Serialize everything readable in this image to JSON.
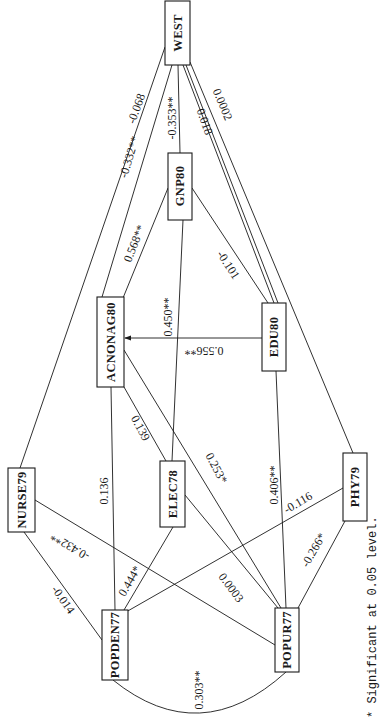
{
  "diagram": {
    "type": "path-diagram",
    "orientation": "rotated-90-clockwise",
    "nodes": [
      {
        "id": "WEST",
        "label": "WEST",
        "x": 165,
        "y": 1,
        "w": 25,
        "h": 64
      },
      {
        "id": "GNP80",
        "label": "GNP80",
        "x": 168,
        "y": 153,
        "w": 24,
        "h": 67
      },
      {
        "id": "ACNONAG80",
        "label": "ACNONAG80",
        "x": 97,
        "y": 297,
        "w": 27,
        "h": 90
      },
      {
        "id": "EDU80",
        "label": "EDU80",
        "x": 262,
        "y": 303,
        "w": 24,
        "h": 68
      },
      {
        "id": "NURSE79",
        "label": "NURSE79",
        "x": 8,
        "y": 468,
        "w": 27,
        "h": 64
      },
      {
        "id": "ELEC78",
        "label": "ELEC78",
        "x": 160,
        "y": 461,
        "w": 25,
        "h": 66
      },
      {
        "id": "PHY79",
        "label": "PHY79",
        "x": 343,
        "y": 453,
        "w": 24,
        "h": 68
      },
      {
        "id": "POPDEN77",
        "label": "POPDEN77",
        "x": 102,
        "y": 610,
        "w": 26,
        "h": 70
      },
      {
        "id": "POPUR77",
        "label": "POPUR77",
        "x": 275,
        "y": 608,
        "w": 24,
        "h": 64
      }
    ],
    "edges": [
      {
        "from": "WEST",
        "to": "NURSE79",
        "label": "-0.068",
        "significance": "none"
      },
      {
        "from": "WEST",
        "to": "ACNONAG80",
        "label": "-0.332**",
        "significance": "**"
      },
      {
        "from": "WEST",
        "to": "GNP80",
        "label": "-0.353**",
        "significance": "**"
      },
      {
        "from": "WEST",
        "to": "EDU80",
        "label": "0.018",
        "significance": "none"
      },
      {
        "from": "WEST",
        "to": "PHY79",
        "label": "0.0002",
        "significance": "none"
      },
      {
        "from": "GNP80",
        "to": "ACNONAG80",
        "label": "0.568**",
        "significance": "**"
      },
      {
        "from": "GNP80",
        "to": "EDU80",
        "label": "-0.101",
        "significance": "none"
      },
      {
        "from": "GNP80",
        "to": "ELEC78",
        "label": "0.450**",
        "significance": "**"
      },
      {
        "from": "EDU80",
        "to": "ACNONAG80",
        "label": "0.556**",
        "significance": "**",
        "arrow": true
      },
      {
        "from": "ACNONAG80",
        "to": "POPDEN77",
        "label": "0.136",
        "significance": "none"
      },
      {
        "from": "ACNONAG80",
        "to": "ELEC78",
        "label": "0.139",
        "significance": "none"
      },
      {
        "from": "ACNONAG80",
        "to": "POPUR77",
        "label": "0.253*",
        "significance": "*"
      },
      {
        "from": "EDU80",
        "to": "POPUR77",
        "label": "0.406**",
        "significance": "**"
      },
      {
        "from": "NURSE79",
        "to": "POPDEN77",
        "label": "-0.014",
        "significance": "none"
      },
      {
        "from": "NURSE79",
        "to": "POPUR77",
        "label": "-0.432**",
        "significance": "**"
      },
      {
        "from": "ELEC78",
        "to": "POPDEN77",
        "label": "0.444*",
        "significance": "*"
      },
      {
        "from": "ELEC78",
        "to": "POPUR77",
        "label": "0.0003",
        "significance": "none"
      },
      {
        "from": "PHY79",
        "to": "POPDEN77",
        "label": "-0.116",
        "significance": "none"
      },
      {
        "from": "PHY79",
        "to": "POPUR77",
        "label": "-0.266*",
        "significance": "*"
      },
      {
        "from": "POPDEN77",
        "to": "POPUR77",
        "label": "0.303**",
        "significance": "**",
        "curved": true
      }
    ]
  },
  "nodes": {
    "west": "WEST",
    "gnp80": "GNP80",
    "acnonag80": "ACNONAG80",
    "edu80": "EDU80",
    "nurse79": "NURSE79",
    "elec78": "ELEC78",
    "phy79": "PHY79",
    "popden77": "POPDEN77",
    "popur77": "POPUR77"
  },
  "edge_labels": {
    "west_nurse79": "-0.068",
    "west_acnonag80": "-0.332**",
    "west_gnp80": "-0.353**",
    "west_edu80": "0.018",
    "west_phy79": "0.0002",
    "gnp80_acnonag80": "0.568**",
    "gnp80_edu80": "-0.101",
    "gnp80_elec78": "0.450**",
    "edu80_acnonag80": "0.556**",
    "acnonag80_popden77": "0.136",
    "acnonag80_elec78": "0.139",
    "acnonag80_popur77": "0.253*",
    "edu80_popur77": "0.406**",
    "nurse79_popden77": "-0.014",
    "nurse79_popur77": "-0.432**",
    "elec78_popden77": "0.444*",
    "elec78_popur77": "0.0003",
    "phy79_popden77": "-0.116",
    "phy79_popur77": "-0.266*",
    "popden77_popur77": "0.303**"
  },
  "legend": {
    "text": "* Significant at 0.05 level."
  }
}
